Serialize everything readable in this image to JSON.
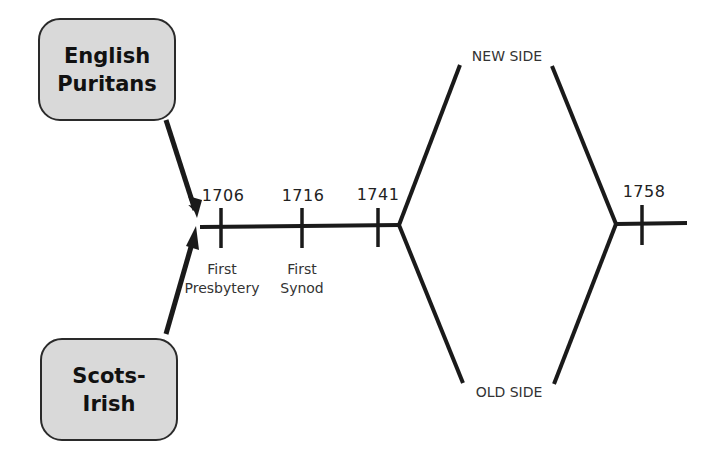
{
  "diagram": {
    "type": "timeline-branching",
    "sources": [
      {
        "id": "english-puritans",
        "label": "English\nPuritans"
      },
      {
        "id": "scots-irish",
        "label": "Scots-\nIrish"
      }
    ],
    "timeline": {
      "ticks": [
        {
          "year": "1706",
          "event": "First\nPresbytery"
        },
        {
          "year": "1716",
          "event": "First\nSynod"
        },
        {
          "year": "1741",
          "event": ""
        },
        {
          "year": "1758",
          "event": ""
        }
      ]
    },
    "branches": {
      "upper": "NEW SIDE",
      "lower": "OLD SIDE"
    },
    "colors": {
      "line": "#1a1a1a",
      "box_fill": "#d9d9d9",
      "box_border": "#2a2a2a",
      "background": "#ffffff"
    }
  }
}
